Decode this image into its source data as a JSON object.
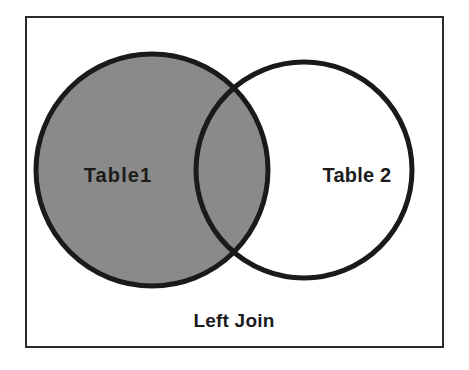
{
  "diagram": {
    "type": "venn",
    "title": "Left Join",
    "caption": "Left Join",
    "frame": {
      "border_color": "#2b2b2b",
      "background_color": "#ffffff"
    },
    "sets": [
      {
        "id": "left",
        "label": "Table1",
        "fill_color": "#8a8a8a",
        "stroke_color": "#1a1a1a",
        "filled": true,
        "center_x": 152,
        "center_y": 170,
        "radius": 116
      },
      {
        "id": "right",
        "label": "Table 2",
        "fill_color": "#ffffff",
        "stroke_color": "#1a1a1a",
        "filled": false,
        "center_x": 304,
        "center_y": 170,
        "radius": 108
      }
    ],
    "overlap": {
      "label": "intersection",
      "fill_color": "#8a8a8a",
      "highlighted": true
    },
    "highlight_description": "All of Table1 including the overlap with Table 2 is shaded"
  }
}
